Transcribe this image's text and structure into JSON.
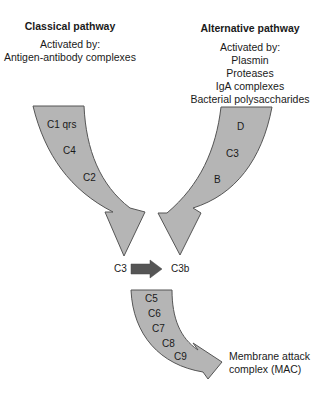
{
  "classical": {
    "title": "Classical pathway",
    "activated_by_label": "Activated by:",
    "activators": [
      "Antigen-antibody complexes"
    ],
    "components": [
      "C1 qrs",
      "C4",
      "C2"
    ]
  },
  "alternative": {
    "title": "Alternative pathway",
    "activated_by_label": "Activated by:",
    "activators": [
      "Plasmin",
      "Proteases",
      "IgA complexes",
      "Bacterial polysaccharides"
    ],
    "components": [
      "D",
      "C3",
      "B"
    ]
  },
  "conversion": {
    "from": "C3",
    "to": "C3b"
  },
  "terminal": {
    "components": [
      "C5",
      "C6",
      "C7",
      "C8",
      "C9"
    ],
    "result_line1": "Membrane attack",
    "result_line2": "complex (MAC)"
  },
  "colors": {
    "arrow_fill": "#b5b5b5",
    "arrow_stroke": "#555555",
    "conversion_arrow": "#555555"
  }
}
